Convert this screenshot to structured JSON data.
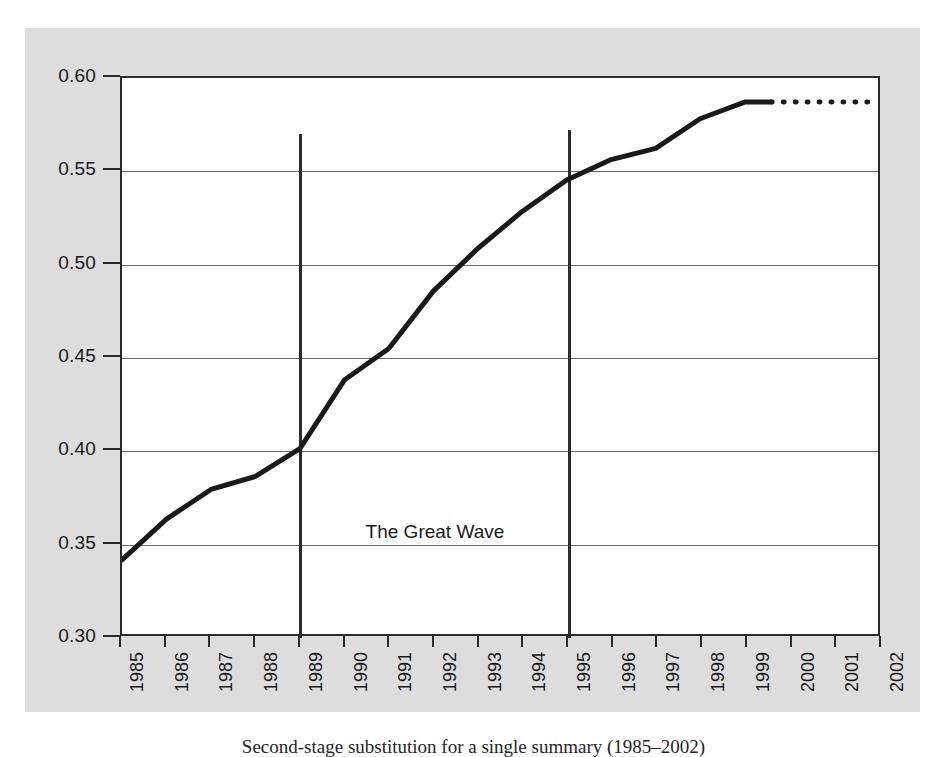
{
  "figure": {
    "caption": "Second-stage substitution for a single summary (1985–2002)",
    "background_color": "#dddddd",
    "plot_background_color": "#ffffff",
    "axis_color": "#2b2b2b",
    "gridline_color": "#6b6b6b",
    "series_color": "#1a1a1a"
  },
  "annotations": {
    "great_wave_label": "The Great Wave",
    "great_wave_start_year": 1989,
    "great_wave_end_year": 1995,
    "great_wave_y": 0.35,
    "vline_left_top_value": 0.57,
    "vline_right_top_value": 0.572
  },
  "chart_data": {
    "type": "line",
    "title": "",
    "subtitle": "",
    "xlabel": "",
    "ylabel": "",
    "xlim": [
      1985,
      2002
    ],
    "ylim": [
      0.3,
      0.6
    ],
    "grid": true,
    "legend": "none",
    "x_tick_labels": [
      "1985",
      "1986",
      "1987",
      "1988",
      "1989",
      "1990",
      "1991",
      "1992",
      "1993",
      "1994",
      "1995",
      "1996",
      "1997",
      "1998",
      "1999",
      "2000",
      "2001",
      "2002"
    ],
    "y_tick_labels": [
      "0.60",
      "0.55",
      "0.50",
      "0.45",
      "0.40",
      "0.35",
      "0.30"
    ],
    "y_ticks": [
      0.6,
      0.55,
      0.5,
      0.45,
      0.4,
      0.35,
      0.3
    ],
    "series": [
      {
        "name": "observed",
        "style": "solid",
        "x": [
          1985,
          1986,
          1987,
          1988,
          1989,
          1990,
          1991,
          1992,
          1993,
          1994,
          1995,
          1996,
          1997,
          1998,
          1999,
          1999.6
        ],
        "values": [
          0.34,
          0.362,
          0.378,
          0.385,
          0.4,
          0.437,
          0.454,
          0.485,
          0.508,
          0.528,
          0.545,
          0.556,
          0.562,
          0.578,
          0.587,
          0.587
        ]
      },
      {
        "name": "projected",
        "style": "dotted",
        "x": [
          1999.6,
          2000,
          2001,
          2002
        ],
        "values": [
          0.587,
          0.587,
          0.587,
          0.587
        ]
      }
    ]
  }
}
